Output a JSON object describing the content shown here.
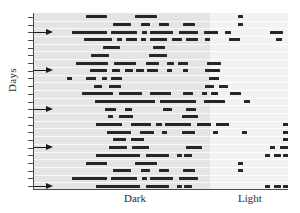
{
  "figure": {
    "type": "actogram",
    "y_axis_title": "Days",
    "x_labels": {
      "dark": "Dark",
      "light": "Light"
    },
    "colors": {
      "bar": "#262626",
      "zone_dark": "#e4e4e4",
      "zone_light": "#f2f2f2",
      "axis": "#4a4a4a",
      "text": "#2b2b2b"
    },
    "axis": {
      "x_range_pct": [
        0,
        100
      ],
      "dark_light_boundary_pct": 69.4,
      "n_day_rows": 23,
      "n_y_ticks": 23,
      "grid": "horizontal day separators only",
      "legend": "none"
    }
  },
  "chart_data": {
    "type": "bar",
    "title": "",
    "xlabel": "",
    "ylabel": "Days",
    "ylim": [
      0,
      23
    ],
    "xlim": [
      0,
      100
    ],
    "annotations": [
      {
        "text": "Dark",
        "x_pct": 35
      },
      {
        "text": "Light",
        "x_pct": 85
      }
    ],
    "marker_rows": [
      2,
      7,
      12,
      17,
      22
    ],
    "marker_symbol": "arrow-right",
    "categories": [
      "day-1",
      "day-2",
      "day-3",
      "day-4",
      "day-5",
      "day-6",
      "day-7",
      "day-8",
      "day-9",
      "day-10",
      "day-11",
      "day-12",
      "day-13",
      "day-14",
      "day-15",
      "day-16",
      "day-17",
      "day-18",
      "day-19",
      "day-20",
      "day-21",
      "day-22",
      "day-23"
    ],
    "series": [
      {
        "name": "activity-bouts",
        "note": "each row is one day; values are [start_pct, width_pct] activity bouts along the 24h axis",
        "rows": [
          [
            [
              20.3,
              8.2
            ],
            [
              39.6,
              8.6
            ],
            [
              80.0,
              2.0
            ]
          ],
          [
            [
              30.8,
              7.3
            ],
            [
              41.9,
              3.7
            ],
            [
              49.0,
              4.0
            ],
            [
              58.6,
              4.7
            ],
            [
              80.0,
              2.0
            ]
          ],
          [
            [
              15.0,
              13.5
            ],
            [
              30.0,
              10.5
            ],
            [
              42.2,
              2.0
            ],
            [
              45.6,
              9.0
            ],
            [
              57.0,
              7.5
            ],
            [
              66.5,
              5.6
            ],
            [
              75.0,
              2.4
            ],
            [
              92.5,
              5.0
            ]
          ],
          [
            [
              19.5,
              11.0
            ],
            [
              32.5,
              2.2
            ],
            [
              36.0,
              4.3
            ],
            [
              42.0,
              2.0
            ],
            [
              45.5,
              6.5
            ],
            [
              54.0,
              4.0
            ],
            [
              59.5,
              5.0
            ],
            [
              67.0,
              2.2
            ],
            [
              76.5,
              4.2
            ],
            [
              95.0,
              2.3
            ]
          ],
          [
            [
              27.0,
              6.8
            ],
            [
              46.5,
              5.0
            ]
          ],
          [
            [
              22.5,
              6.8
            ],
            [
              45.0,
              7.3
            ],
            [
              118.0,
              4.8
            ]
          ],
          [
            [
              16.5,
              12.5
            ],
            [
              31.5,
              8.4
            ],
            [
              44.0,
              5.0
            ],
            [
              52.0,
              3.0
            ],
            [
              56.5,
              3.8
            ],
            [
              68.0,
              5.4
            ],
            [
              101.0,
              2.4
            ]
          ],
          [
            [
              22.0,
              6.6
            ],
            [
              30.5,
              3.4
            ],
            [
              35.5,
              3.2
            ],
            [
              40.0,
              3.0
            ],
            [
              44.5,
              4.0
            ],
            [
              52.0,
              2.0
            ],
            [
              58.5,
              2.0
            ],
            [
              67.0,
              6.0
            ]
          ],
          [
            [
              13.0,
              2.0
            ],
            [
              20.5,
              4.0
            ],
            [
              26.5,
              2.0
            ],
            [
              30.0,
              4.4
            ],
            [
              68.5,
              4.2
            ]
          ],
          [
            [
              23.5,
              3.0
            ],
            [
              29.5,
              4.6
            ],
            [
              67.0,
              3.4
            ],
            [
              72.5,
              3.5
            ]
          ],
          [
            [
              19.0,
              12.0
            ],
            [
              33.5,
              9.0
            ],
            [
              45.5,
              8.2
            ],
            [
              58.5,
              4.0
            ],
            [
              66.0,
              2.0
            ],
            [
              69.5,
              2.8
            ],
            [
              77.0,
              4.2
            ]
          ],
          [
            [
              24.0,
              23.5
            ],
            [
              49.5,
              14.0
            ],
            [
              66.5,
              8.4
            ],
            [
              82.5,
              2.4
            ]
          ],
          [
            [
              28.0,
              4.0
            ],
            [
              35.5,
              3.0
            ],
            [
              50.5,
              3.8
            ],
            [
              59.5,
              4.0
            ]
          ],
          [
            [
              29.0,
              2.0
            ],
            [
              33.5,
              5.2
            ],
            [
              58.0,
              6.5
            ],
            [
              61.0,
              2.0
            ]
          ],
          [
            [
              24.5,
              10.2
            ],
            [
              38.0,
              8.0
            ],
            [
              48.0,
              2.2
            ],
            [
              51.5,
              10.0
            ],
            [
              64.0,
              5.5
            ],
            [
              71.5,
              4.8
            ],
            [
              97.5,
              3.0
            ]
          ],
          [
            [
              28.5,
              9.6
            ],
            [
              41.5,
              5.6
            ],
            [
              50.0,
              2.0
            ],
            [
              58.0,
              5.0
            ],
            [
              70.0,
              2.0
            ],
            [
              81.5,
              2.0
            ],
            [
              97.5,
              3.0
            ]
          ],
          [
            [
              31.0,
              5.0
            ],
            [
              38.0,
              5.0
            ],
            [
              97.5,
              3.0
            ]
          ],
          [
            [
              29.5,
              7.0
            ],
            [
              38.5,
              6.5
            ],
            [
              59.5,
              6.5
            ],
            [
              92.5,
              2.0
            ],
            [
              96.5,
              3.0
            ]
          ],
          [
            [
              24.5,
              17.0
            ],
            [
              44.0,
              9.0
            ],
            [
              56.0,
              2.0
            ],
            [
              59.0,
              2.8
            ],
            [
              90.5,
              2.0
            ],
            [
              94.0,
              3.0
            ],
            [
              97.5,
              3.0
            ]
          ],
          [
            [
              20.3,
              8.2
            ],
            [
              39.6,
              8.6
            ],
            [
              80.0,
              2.0
            ]
          ],
          [
            [
              30.8,
              7.3
            ],
            [
              41.9,
              3.7
            ],
            [
              49.0,
              4.0
            ],
            [
              58.6,
              4.7
            ],
            [
              80.0,
              2.0
            ]
          ],
          [
            [
              15.0,
              13.5
            ],
            [
              30.0,
              10.5
            ],
            [
              42.2,
              2.0
            ],
            [
              45.6,
              9.0
            ],
            [
              57.0,
              7.5
            ]
          ],
          [
            [
              24.5,
              17.0
            ],
            [
              44.0,
              9.0
            ],
            [
              56.0,
              2.0
            ],
            [
              59.0,
              2.8
            ],
            [
              90.5,
              2.0
            ],
            [
              94.0,
              3.0
            ],
            [
              97.5,
              3.0
            ]
          ]
        ]
      }
    ]
  }
}
